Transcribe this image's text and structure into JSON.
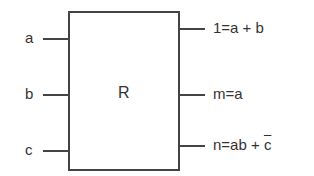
{
  "block": {
    "label": "R"
  },
  "inputs": [
    {
      "name": "a"
    },
    {
      "name": "b"
    },
    {
      "name": "c"
    }
  ],
  "outputs": [
    {
      "expr": "1=a + b"
    },
    {
      "expr": "m=a"
    },
    {
      "expr_prefix": "n=ab + ",
      "expr_overline": "c"
    }
  ]
}
